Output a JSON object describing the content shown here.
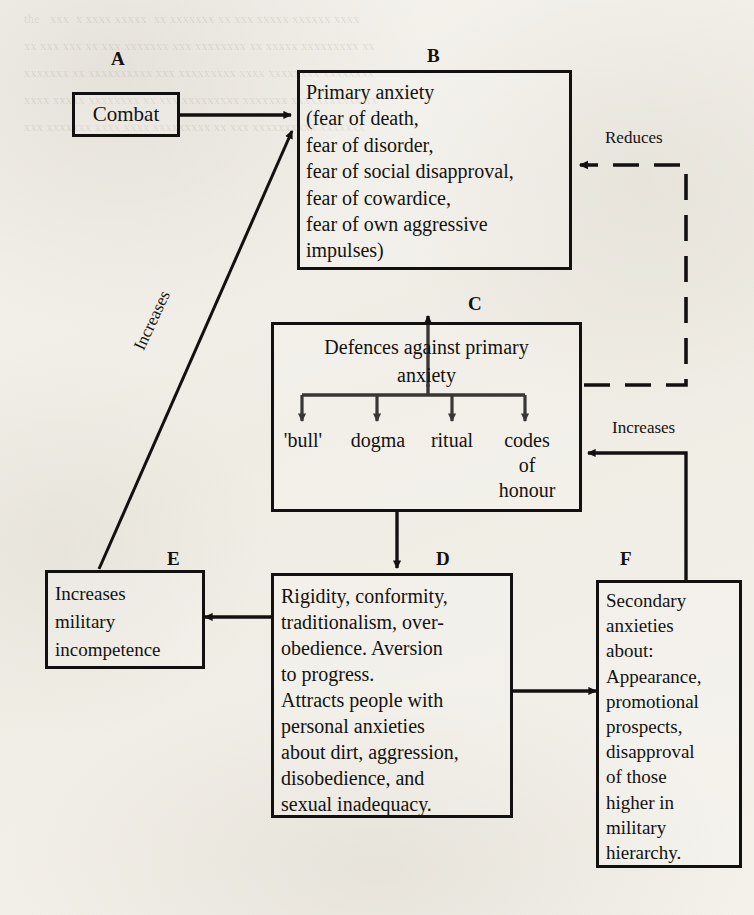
{
  "diagram": {
    "ghost_text": "the   xxx  x xxxx xxxxx  xx xxxxxxx xx xxx xxxxx xxxxxx xxxx\nxx xxx xxx xx xxx xxxxxxx xxx xxxxxxxx xx xxxxx xxxxxxxxx xx\nxxxxxxx xx xxxxxxxxxx xxx xxxxxxxxx xxxx xxxxxxxx xxxxxxxx\nxxxx xxxxx xxxxxxxx xx xxx xxxxxxxxx xxxxxxx xxxxxxxxxxx xx\nxxx xxxxxxx xxxx xxxx xxxxxxxxx xx xxx xxxxxxxxxx xxxxxxx",
    "boxes": [
      {
        "id": "A",
        "letter": "A",
        "name": "combat",
        "text": "Combat",
        "align": "center"
      },
      {
        "id": "B",
        "letter": "B",
        "name": "primary-anxiety",
        "text": "Primary anxiety\n   (fear of death,\n   fear of disorder,\n   fear of social disapproval,\n   fear of cowardice,\n   fear of own aggressive\n           impulses)",
        "align": "left"
      },
      {
        "id": "C",
        "letter": "C",
        "name": "defences-against-primary-anxiety",
        "text": "Defences against primary\nanxiety",
        "align": "center"
      },
      {
        "id": "D",
        "letter": "D",
        "name": "rigidity-conformity",
        "text": "Rigidity, conformity,\ntraditionalism, over-\nobedience. Aversion\nto progress.\n   Attracts people with\npersonal anxieties\nabout dirt, aggression,\ndisobedience, and\nsexual inadequacy.",
        "align": "left"
      },
      {
        "id": "E",
        "letter": "E",
        "name": "increases-military-incompetence",
        "text": "Increases\nmilitary\nincompetence",
        "align": "left"
      },
      {
        "id": "F",
        "letter": "F",
        "name": "secondary-anxieties",
        "text": "Secondary\nanxieties\nabout:\nAppearance,\npromotional\nprospects,\ndisapproval\nof those\nhigher in\nmilitary\nhierarchy.",
        "align": "left"
      }
    ],
    "defence_items": [
      {
        "label": "'bull'"
      },
      {
        "label": "dogma"
      },
      {
        "label": "ritual"
      },
      {
        "label": "codes\nof\nhonour"
      }
    ],
    "edge_labels": [
      {
        "name": "increases-diagonal",
        "text": "Increases"
      },
      {
        "name": "reduces",
        "text": "Reduces"
      },
      {
        "name": "increases-right",
        "text": "Increases"
      }
    ],
    "colors": {
      "ink": "#131110",
      "paper": "#f2f0ea"
    }
  }
}
